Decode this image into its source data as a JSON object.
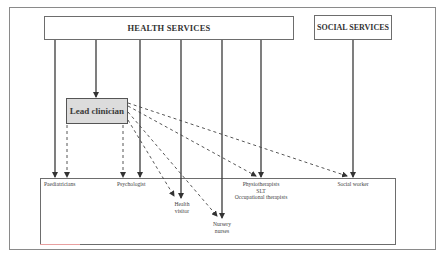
{
  "diagram": {
    "top_boxes": {
      "health_services": "HEALTH SERVICES",
      "social_services": "SOCIAL SERVICES"
    },
    "coordinator": {
      "lead_clinician": "Lead clinician"
    },
    "professionals": [
      {
        "id": "paediatricians",
        "lines": [
          "Paediatricians"
        ]
      },
      {
        "id": "psychologist",
        "lines": [
          "Psychologist"
        ]
      },
      {
        "id": "health-visitor",
        "lines": [
          "Health",
          "visitor"
        ]
      },
      {
        "id": "nursery-nurses",
        "lines": [
          "Nursery",
          "nurses"
        ]
      },
      {
        "id": "therapists",
        "lines": [
          "Physiotherapists",
          "SLT",
          "Occupational therapists"
        ]
      },
      {
        "id": "social-worker",
        "lines": [
          "Social worker"
        ]
      }
    ],
    "edges": {
      "solid": [
        {
          "from": "HEALTH SERVICES",
          "to": "Paediatricians"
        },
        {
          "from": "HEALTH SERVICES",
          "to": "Lead clinician"
        },
        {
          "from": "HEALTH SERVICES",
          "to": "Psychologist"
        },
        {
          "from": "HEALTH SERVICES",
          "to": "Health visitor"
        },
        {
          "from": "HEALTH SERVICES",
          "to": "Nursery nurses"
        },
        {
          "from": "HEALTH SERVICES",
          "to": "Physiotherapists / SLT / Occupational therapists"
        },
        {
          "from": "SOCIAL SERVICES",
          "to": "Social worker"
        }
      ],
      "dashed": [
        {
          "from": "Lead clinician",
          "to": "Paediatricians"
        },
        {
          "from": "Lead clinician",
          "to": "Psychologist"
        },
        {
          "from": "Lead clinician",
          "to": "Health visitor"
        },
        {
          "from": "Lead clinician",
          "to": "Nursery nurses"
        },
        {
          "from": "Lead clinician",
          "to": "Physiotherapists / SLT / Occupational therapists"
        },
        {
          "from": "Lead clinician",
          "to": "Social worker"
        }
      ]
    }
  }
}
